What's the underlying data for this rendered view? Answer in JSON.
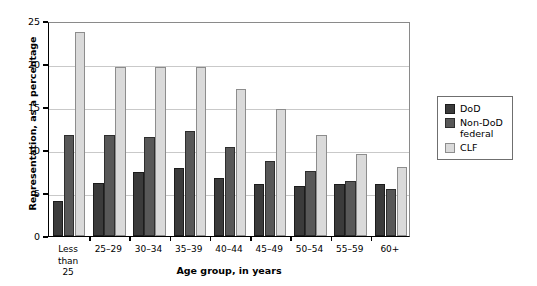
{
  "chart_data": {
    "type": "bar",
    "title": "",
    "xlabel": "Age group, in years",
    "ylabel": "Representation, as a percentage",
    "ylim": [
      0,
      25
    ],
    "yticks": [
      0,
      5,
      10,
      15,
      20,
      25
    ],
    "grid": true,
    "legend_position": "right",
    "categories": [
      "Less than\n25",
      "25–29",
      "30–34",
      "35–39",
      "40–44",
      "45–49",
      "50–54",
      "55–59",
      "60+"
    ],
    "series": [
      {
        "name": "DoD",
        "color": "#3b3b3b",
        "values": [
          4.1,
          6.2,
          7.4,
          7.9,
          6.8,
          6.1,
          5.8,
          6.1,
          6.0
        ]
      },
      {
        "name": "Non-DoD\nfederal",
        "color": "#585858",
        "values": [
          11.7,
          11.8,
          11.5,
          12.2,
          10.4,
          8.7,
          7.6,
          6.4,
          5.5
        ]
      },
      {
        "name": "CLF",
        "color": "#dadada",
        "values": [
          23.7,
          19.6,
          19.6,
          19.7,
          17.1,
          14.8,
          11.7,
          9.5,
          8.0
        ]
      }
    ]
  },
  "legend": {
    "items": [
      {
        "label": "DoD",
        "swatch": "s0"
      },
      {
        "label": "Non-DoD\nfederal",
        "swatch": "s1"
      },
      {
        "label": "CLF",
        "swatch": "s2"
      }
    ]
  }
}
